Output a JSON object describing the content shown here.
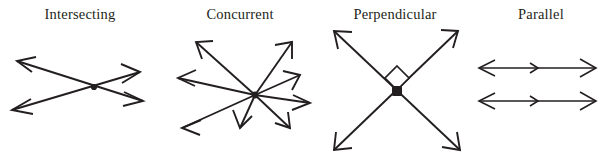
{
  "figure": {
    "title": "",
    "background_color": "#ffffff",
    "stroke_color": "#231f20",
    "panels": [
      {
        "id": "intersecting",
        "label": "Intersecting",
        "icon_name": "two-crossing-lines-icon",
        "description": "Two double-headed arrows crossing at a single marked point",
        "line_count": 2,
        "vertex_count": 1,
        "vertex_marked": true
      },
      {
        "id": "concurrent",
        "label": "Concurrent",
        "icon_name": "concurrent-rays-icon",
        "description": "Eight arrows radiating outward from one common marked point",
        "line_count": 8,
        "vertex_count": 1,
        "vertex_marked": true
      },
      {
        "id": "perpendicular",
        "label": "Perpendicular",
        "icon_name": "perpendicular-lines-icon",
        "description": "Two double-headed arrows crossing at right angles with a square right-angle marker",
        "line_count": 2,
        "vertex_count": 1,
        "vertex_marked": true,
        "right_angle_marker": true,
        "angle_degrees": 90
      },
      {
        "id": "parallel",
        "label": "Parallel",
        "icon_name": "parallel-lines-icon",
        "description": "Two horizontal double-headed arrows that never meet, each with a mid-line direction tick",
        "line_count": 2,
        "vertex_count": 0,
        "vertex_marked": false
      }
    ]
  }
}
